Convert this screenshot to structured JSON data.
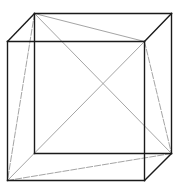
{
  "diagram": {
    "colors": {
      "edge": "#1a1a1a",
      "diagonal": "#9a9a9a",
      "background": "#ffffff"
    },
    "vertices": {
      "BTL": [
        34,
        13
      ],
      "BTR": [
        171,
        13
      ],
      "BBR": [
        171,
        153
      ],
      "BBL": [
        34,
        153
      ],
      "FTL": [
        7,
        41
      ],
      "FTR": [
        144,
        41
      ],
      "FBR": [
        144,
        180
      ],
      "FBL": [
        7,
        180
      ]
    },
    "edges": [
      [
        "BTL",
        "BTR"
      ],
      [
        "BTR",
        "BBR"
      ],
      [
        "BBR",
        "BBL"
      ],
      [
        "BBL",
        "BTL"
      ],
      [
        "FTL",
        "FTR"
      ],
      [
        "FTR",
        "FBR"
      ],
      [
        "FBR",
        "FBL"
      ],
      [
        "FBL",
        "FTL"
      ],
      [
        "FTL",
        "BTL"
      ],
      [
        "FTR",
        "BTR"
      ],
      [
        "FBR",
        "BBR"
      ]
    ],
    "diagonals": [
      {
        "from": "BTL",
        "to": "FTR",
        "dashed": false
      },
      {
        "from": "BTL",
        "to": "FBL",
        "dashed": true
      },
      {
        "from": "BTL",
        "to": "BBR",
        "dashed": false
      },
      {
        "from": "FTR",
        "to": "FBL",
        "dashed": false
      },
      {
        "from": "FTR",
        "to": "BBR",
        "dashed": true
      },
      {
        "from": "BBR",
        "to": "FBL",
        "dashed": true
      }
    ]
  }
}
